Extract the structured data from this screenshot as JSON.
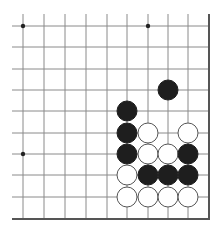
{
  "board": {
    "description": "Go board corner fragment (lower-right corner visible, edges on right and bottom)",
    "x_lines": [
      23,
      44,
      65,
      86,
      107,
      127,
      148,
      168,
      188
    ],
    "right_edge_x": 209,
    "y_lines": [
      26,
      47,
      69,
      90,
      111,
      133,
      154,
      175,
      197
    ],
    "bottom_edge_y": 219,
    "line_start_x": 12,
    "line_start_y": 14,
    "line_color": "#8a8a8a",
    "edge_color": "#555555",
    "stone_radius": 10,
    "star_points": [
      {
        "col": 0,
        "row": 0
      },
      {
        "col": 6,
        "row": 0
      },
      {
        "col": 0,
        "row": 6
      }
    ],
    "colors": {
      "black_stone": "#1e1e1e",
      "white_stone": "#ffffff",
      "white_stroke": "#555555",
      "background": "#ffffff"
    },
    "stones": [
      {
        "color": "black",
        "col": 7,
        "row": 3
      },
      {
        "color": "black",
        "col": 5,
        "row": 4
      },
      {
        "color": "black",
        "col": 5,
        "row": 5
      },
      {
        "color": "white",
        "col": 6,
        "row": 5
      },
      {
        "color": "white",
        "col": 8,
        "row": 5
      },
      {
        "color": "black",
        "col": 5,
        "row": 6
      },
      {
        "color": "white",
        "col": 6,
        "row": 6
      },
      {
        "color": "white",
        "col": 7,
        "row": 6
      },
      {
        "color": "black",
        "col": 8,
        "row": 6
      },
      {
        "color": "white",
        "col": 5,
        "row": 7
      },
      {
        "color": "black",
        "col": 6,
        "row": 7
      },
      {
        "color": "black",
        "col": 7,
        "row": 7
      },
      {
        "color": "black",
        "col": 8,
        "row": 7
      },
      {
        "color": "white",
        "col": 5,
        "row": 8
      },
      {
        "color": "white",
        "col": 6,
        "row": 8
      },
      {
        "color": "white",
        "col": 7,
        "row": 8
      },
      {
        "color": "white",
        "col": 8,
        "row": 8
      }
    ]
  }
}
